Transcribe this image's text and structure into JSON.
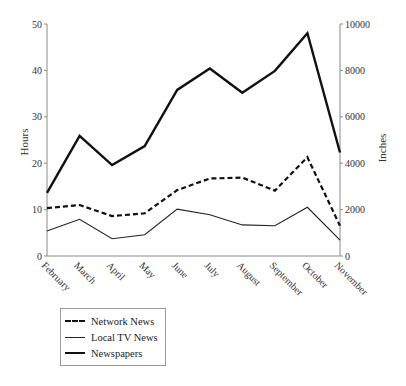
{
  "chart_data": {
    "type": "line",
    "title": "",
    "xlabel": "",
    "ylabel": "Hours",
    "y2label": "Inches",
    "categories": [
      "February",
      "March",
      "April",
      "May",
      "June",
      "July",
      "August",
      "September",
      "October",
      "November"
    ],
    "ylim": [
      0,
      50
    ],
    "y2lim": [
      0,
      10000
    ],
    "yticks": [
      0,
      10,
      20,
      30,
      40,
      50
    ],
    "y2ticks": [
      0,
      2000,
      4000,
      6000,
      8000,
      10000
    ],
    "grid": false,
    "legend_position": "below-left",
    "series": [
      {
        "name": "Network News",
        "axis": "left",
        "style": "dashed",
        "values": [
          10.3,
          11.0,
          8.6,
          9.2,
          14.2,
          16.7,
          16.9,
          14.1,
          21.3,
          6.5
        ]
      },
      {
        "name": "Local TV News",
        "axis": "left",
        "style": "thin",
        "values": [
          5.4,
          7.9,
          3.7,
          4.6,
          10.1,
          8.9,
          6.7,
          6.5,
          10.5,
          3.4
        ]
      },
      {
        "name": "Newspapers",
        "axis": "right",
        "style": "thick",
        "values": [
          2720,
          5180,
          3920,
          4740,
          7160,
          8080,
          7040,
          7980,
          9600,
          4460
        ]
      }
    ]
  },
  "legend": {
    "items": [
      {
        "label": "Network News"
      },
      {
        "label": "Local TV News"
      },
      {
        "label": "Newspapers"
      }
    ]
  }
}
